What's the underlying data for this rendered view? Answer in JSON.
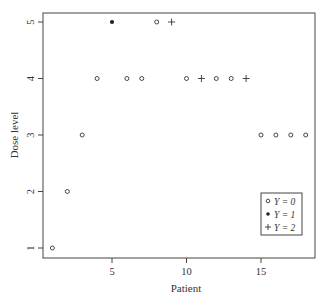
{
  "chart_data": {
    "type": "scatter",
    "title": "",
    "xlabel": "Patient",
    "ylabel": "Dose level",
    "xlim": [
      0.3,
      18.6
    ],
    "ylim": [
      0.85,
      5.25
    ],
    "xticks": [
      5,
      10,
      15
    ],
    "yticks": [
      1,
      2,
      3,
      4,
      5
    ],
    "grid": false,
    "legend_position": "bottom-right",
    "legend": [
      {
        "label": "Y = 0",
        "marker": "open-circle"
      },
      {
        "label": "Y = 1",
        "marker": "filled-circle"
      },
      {
        "label": "Y = 2",
        "marker": "plus"
      }
    ],
    "points": [
      {
        "x": 1,
        "y": 1,
        "Y": 0
      },
      {
        "x": 2,
        "y": 2,
        "Y": 0
      },
      {
        "x": 3,
        "y": 3,
        "Y": 0
      },
      {
        "x": 4,
        "y": 4,
        "Y": 0
      },
      {
        "x": 5,
        "y": 5,
        "Y": 1
      },
      {
        "x": 6,
        "y": 4,
        "Y": 0
      },
      {
        "x": 7,
        "y": 4,
        "Y": 0
      },
      {
        "x": 8,
        "y": 5,
        "Y": 0
      },
      {
        "x": 9,
        "y": 5,
        "Y": 2
      },
      {
        "x": 10,
        "y": 4,
        "Y": 0
      },
      {
        "x": 11,
        "y": 4,
        "Y": 2
      },
      {
        "x": 12,
        "y": 4,
        "Y": 0
      },
      {
        "x": 13,
        "y": 4,
        "Y": 0
      },
      {
        "x": 14,
        "y": 4,
        "Y": 2
      },
      {
        "x": 15,
        "y": 3,
        "Y": 0
      },
      {
        "x": 16,
        "y": 3,
        "Y": 0
      },
      {
        "x": 17,
        "y": 3,
        "Y": 0
      },
      {
        "x": 18,
        "y": 3,
        "Y": 0
      }
    ]
  },
  "legend": {
    "y0": "Y = 0",
    "y1": "Y = 1",
    "y2": "Y = 2"
  },
  "axes": {
    "xlabel": "Patient",
    "ylabel": "Dose level"
  }
}
